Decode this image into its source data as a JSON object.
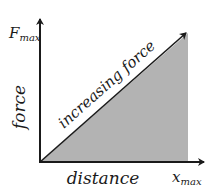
{
  "diagram": {
    "type": "force-distance graph",
    "y_axis_label": "force",
    "x_axis_label": "distance",
    "y_max_label": {
      "main": "F",
      "sub": "max"
    },
    "x_max_label": {
      "main": "x",
      "sub": "max"
    },
    "diagonal_label": "increasing force",
    "colors": {
      "shaded_area": "#b3b3b3",
      "lines": "#1a1a1a",
      "background": "#ffffff"
    }
  }
}
